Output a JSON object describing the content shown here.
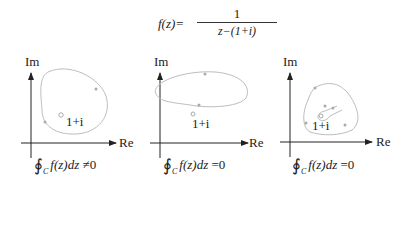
{
  "formula": {
    "lhs": "f(z)=",
    "numerator": "1",
    "denominator": "z−(1+i)"
  },
  "panels": [
    {
      "axis_labels": {
        "im": "Im",
        "re": "Re"
      },
      "point_label": "1+i",
      "contour": "closed loop enclosing the pole 1+i",
      "integral": {
        "symbol": "∮",
        "subscript": "C",
        "expr": "f(z)dz",
        "relation": "≠",
        "value": "0"
      }
    },
    {
      "axis_labels": {
        "im": "Im",
        "re": "Re"
      },
      "point_label": "1+i",
      "contour": "ellipse above the pole, not enclosing it",
      "integral": {
        "symbol": "∮",
        "subscript": "C",
        "expr": "f(z)dz",
        "relation": "=",
        "value": "0"
      }
    },
    {
      "axis_labels": {
        "im": "Im",
        "re": "Re"
      },
      "point_label": "1+i",
      "contour": "keyhole contour excluding the pole",
      "integral": {
        "symbol": "∮",
        "subscript": "C",
        "expr": "f(z)dz",
        "relation": "=",
        "value": "0"
      }
    }
  ],
  "colors": {
    "axis": "#222222",
    "contour": "#bdbdbd",
    "pole": "#999999",
    "text": "#222222"
  }
}
